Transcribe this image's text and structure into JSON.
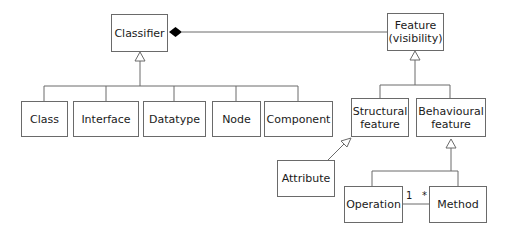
{
  "diagram": {
    "type": "UML class diagram",
    "classes": [
      {
        "id": "classifier",
        "lines": [
          "Classifier"
        ]
      },
      {
        "id": "feature",
        "lines": [
          "Feature",
          "(visibility)"
        ]
      },
      {
        "id": "class",
        "lines": [
          "Class"
        ]
      },
      {
        "id": "interface",
        "lines": [
          "Interface"
        ]
      },
      {
        "id": "datatype",
        "lines": [
          "Datatype"
        ]
      },
      {
        "id": "node",
        "lines": [
          "Node"
        ]
      },
      {
        "id": "component",
        "lines": [
          "Component"
        ]
      },
      {
        "id": "structural",
        "lines": [
          "Structural",
          "feature"
        ]
      },
      {
        "id": "behavioural",
        "lines": [
          "Behavioural",
          "feature"
        ]
      },
      {
        "id": "attribute",
        "lines": [
          "Attribute"
        ]
      },
      {
        "id": "operation",
        "lines": [
          "Operation"
        ]
      },
      {
        "id": "method",
        "lines": [
          "Method"
        ]
      }
    ],
    "relationships": [
      {
        "type": "composition",
        "whole": "Classifier",
        "part": "Feature"
      },
      {
        "type": "generalization",
        "parent": "Classifier",
        "children": [
          "Class",
          "Interface",
          "Datatype",
          "Node",
          "Component"
        ]
      },
      {
        "type": "generalization",
        "parent": "Feature",
        "children": [
          "Structural feature",
          "Behavioural feature"
        ]
      },
      {
        "type": "generalization",
        "parent": "Structural feature",
        "children": [
          "Attribute"
        ]
      },
      {
        "type": "generalization",
        "parent": "Behavioural feature",
        "children": [
          "Operation",
          "Method"
        ]
      },
      {
        "type": "association",
        "from": "Operation",
        "to": "Method",
        "from_multiplicity": "1",
        "to_multiplicity": "*"
      }
    ],
    "multiplicities": {
      "operation_end": "1",
      "method_end": "*"
    },
    "colors": {
      "line": "#6a6a6a",
      "diamond": "#000000",
      "text": "#1a1a1a"
    }
  }
}
